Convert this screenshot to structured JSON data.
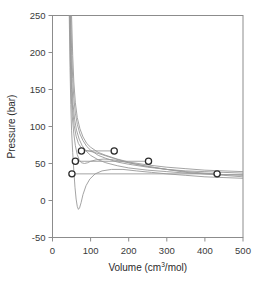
{
  "chart_data": {
    "type": "line",
    "title": "",
    "xlabel": "Volume (cm3/mol)",
    "xlabel_base": "Volume (cm",
    "xlabel_sup": "3",
    "xlabel_tail": "/mol)",
    "ylabel": "Pressure (bar)",
    "xlim": [
      0,
      500
    ],
    "ylim": [
      -50,
      250
    ],
    "xticks": [
      0,
      100,
      200,
      300,
      400,
      500
    ],
    "yticks": [
      -50,
      0,
      50,
      100,
      150,
      200,
      250
    ],
    "grid": false,
    "legend": null,
    "curve_color": "#9a9a9a",
    "marker_edge_color": "#2b2b2b",
    "marker_face_color": "#ffffff",
    "axis_color": "#8c8c8c",
    "series": [
      {
        "name": "isotherm-1-highest",
        "note": "supercritical, monotonic",
        "points": [
          [
            50,
            250
          ],
          [
            53,
            196
          ],
          [
            56,
            160
          ],
          [
            60,
            132
          ],
          [
            65,
            112
          ],
          [
            72,
            97
          ],
          [
            80,
            86
          ],
          [
            90,
            77
          ],
          [
            100,
            72
          ],
          [
            120,
            65
          ],
          [
            140,
            61
          ],
          [
            170,
            56
          ],
          [
            200,
            52
          ],
          [
            250,
            48
          ],
          [
            300,
            45
          ],
          [
            350,
            43
          ],
          [
            400,
            41
          ],
          [
            450,
            40
          ],
          [
            500,
            39
          ]
        ]
      },
      {
        "name": "isotherm-2",
        "points": [
          [
            48,
            250
          ],
          [
            50,
            205
          ],
          [
            53,
            165
          ],
          [
            56,
            138
          ],
          [
            60,
            118
          ],
          [
            65,
            103
          ],
          [
            72,
            90
          ],
          [
            80,
            81
          ],
          [
            90,
            73
          ],
          [
            100,
            68
          ],
          [
            120,
            61
          ],
          [
            140,
            57
          ],
          [
            170,
            52
          ],
          [
            200,
            49
          ],
          [
            250,
            45
          ],
          [
            300,
            42
          ],
          [
            350,
            40
          ],
          [
            400,
            39
          ],
          [
            450,
            38
          ],
          [
            500,
            37
          ]
        ]
      },
      {
        "name": "isotherm-3",
        "points": [
          [
            47,
            250
          ],
          [
            49,
            196
          ],
          [
            51,
            158
          ],
          [
            54,
            130
          ],
          [
            58,
            110
          ],
          [
            63,
            95
          ],
          [
            70,
            83
          ],
          [
            78,
            74
          ],
          [
            88,
            67
          ],
          [
            100,
            61
          ],
          [
            120,
            55
          ],
          [
            140,
            51
          ],
          [
            170,
            47
          ],
          [
            200,
            44
          ],
          [
            250,
            41
          ],
          [
            300,
            39
          ],
          [
            350,
            37
          ],
          [
            400,
            36
          ],
          [
            450,
            35
          ],
          [
            500,
            35
          ]
        ]
      },
      {
        "name": "isotherm-critical",
        "note": "critical isotherm, inflection near V=95",
        "points": [
          [
            46,
            250
          ],
          [
            48,
            190
          ],
          [
            50,
            150
          ],
          [
            53,
            122
          ],
          [
            57,
            101
          ],
          [
            62,
            87
          ],
          [
            68,
            77
          ],
          [
            76,
            71
          ],
          [
            85,
            68
          ],
          [
            95,
            67
          ],
          [
            110,
            65
          ],
          [
            130,
            62
          ],
          [
            160,
            57
          ],
          [
            200,
            51
          ],
          [
            250,
            46
          ],
          [
            300,
            42
          ],
          [
            350,
            39
          ],
          [
            400,
            37
          ],
          [
            450,
            35
          ],
          [
            500,
            34
          ]
        ]
      },
      {
        "name": "isotherm-subcritical-1",
        "note": "van der Waals loop, shallow",
        "points": [
          [
            45,
            250
          ],
          [
            47,
            188
          ],
          [
            49,
            145
          ],
          [
            52,
            113
          ],
          [
            56,
            90
          ],
          [
            60,
            74
          ],
          [
            65,
            62
          ],
          [
            70,
            55
          ],
          [
            76,
            51
          ],
          [
            84,
            50
          ],
          [
            92,
            51
          ],
          [
            100,
            53
          ],
          [
            115,
            55
          ],
          [
            135,
            56
          ],
          [
            160,
            55
          ],
          [
            200,
            51
          ],
          [
            250,
            46
          ],
          [
            300,
            42
          ],
          [
            350,
            38
          ],
          [
            400,
            36
          ],
          [
            450,
            34
          ],
          [
            500,
            32
          ]
        ]
      },
      {
        "name": "isotherm-subcritical-2-lowest",
        "note": "deep van der Waals loop dipping below zero",
        "points": [
          [
            44,
            250
          ],
          [
            46,
            180
          ],
          [
            48,
            130
          ],
          [
            50,
            95
          ],
          [
            53,
            65
          ],
          [
            56,
            40
          ],
          [
            59,
            18
          ],
          [
            62,
            2
          ],
          [
            65,
            -8
          ],
          [
            68,
            -12
          ],
          [
            71,
            -10
          ],
          [
            75,
            -3
          ],
          [
            80,
            8
          ],
          [
            88,
            20
          ],
          [
            98,
            29
          ],
          [
            112,
            36
          ],
          [
            130,
            40
          ],
          [
            155,
            42
          ],
          [
            185,
            42
          ],
          [
            220,
            40
          ],
          [
            260,
            38
          ],
          [
            300,
            36
          ],
          [
            350,
            34
          ],
          [
            400,
            32
          ],
          [
            450,
            31
          ],
          [
            500,
            30
          ]
        ]
      }
    ],
    "markers": [
      {
        "name": "saturation-point-liquid-high",
        "x": 76,
        "y": 67
      },
      {
        "name": "saturation-point-vapor-high",
        "x": 162,
        "y": 67
      },
      {
        "name": "saturation-point-liquid-mid",
        "x": 60,
        "y": 53
      },
      {
        "name": "saturation-point-vapor-mid",
        "x": 252,
        "y": 53
      },
      {
        "name": "saturation-point-liquid-low",
        "x": 51,
        "y": 36
      },
      {
        "name": "saturation-point-vapor-low",
        "x": 432,
        "y": 36
      }
    ],
    "tie_lines": [
      {
        "name": "tie-line-high",
        "y": 67,
        "x_start": 76,
        "x_end": 162
      },
      {
        "name": "tie-line-mid",
        "y": 53,
        "x_start": 60,
        "x_end": 252
      },
      {
        "name": "tie-line-low",
        "y": 36,
        "x_start": 51,
        "x_end": 432
      }
    ]
  }
}
